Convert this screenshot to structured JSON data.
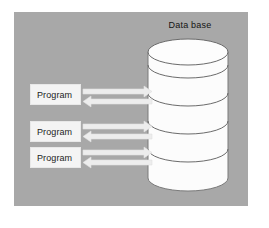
{
  "figure": {
    "kind": "database-access-diagram",
    "background_color": "#ffffff",
    "panel_color": "#a8a8a8",
    "panel": {
      "x": 14,
      "y": 12,
      "width": 234,
      "height": 194
    }
  },
  "database": {
    "title": "Data base",
    "shape": "stacked-cylinder",
    "disk_count": 4,
    "fill_color": "#fcfcfc",
    "stroke_color": "#6b6b6b",
    "bounds": {
      "x": 148,
      "y": 40,
      "width": 80,
      "height": 150
    }
  },
  "programs": [
    {
      "label": "Program",
      "box_color": "#f4f4f4",
      "text_color": "#1c1c1c"
    },
    {
      "label": "Program",
      "box_color": "#f4f4f4",
      "text_color": "#1c1c1c"
    },
    {
      "label": "Program",
      "box_color": "#f4f4f4",
      "text_color": "#1c1c1c"
    }
  ],
  "connectors": [
    {
      "from": "Program",
      "to": "Data base",
      "direction": "bidirectional",
      "outbound": "right",
      "inbound": "left",
      "color": "#ededed"
    },
    {
      "from": "Program",
      "to": "Data base",
      "direction": "bidirectional",
      "outbound": "right",
      "inbound": "left",
      "color": "#ededed"
    },
    {
      "from": "Program",
      "to": "Data base",
      "direction": "bidirectional",
      "outbound": "right",
      "inbound": "left",
      "color": "#ededed"
    }
  ]
}
